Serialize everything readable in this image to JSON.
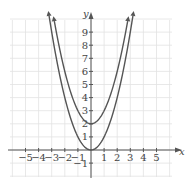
{
  "chart_data": {
    "type": "line",
    "title": "",
    "xlabel": "x",
    "ylabel": "y",
    "xlim": [
      -5.5,
      6.5
    ],
    "ylim": [
      -2,
      10.5
    ],
    "grid": true,
    "legend": null,
    "x_ticks": [
      "-5",
      "-4",
      "-3",
      "-2",
      "-1",
      "1",
      "2",
      "3",
      "4",
      "5"
    ],
    "y_ticks": [
      "-1",
      "1",
      "2",
      "3",
      "4",
      "5",
      "6",
      "7",
      "8",
      "9"
    ],
    "series": [
      {
        "name": "y = x^2",
        "equation": "y = x^2",
        "x": [
          -3.2,
          -3,
          -2,
          -1,
          0,
          1,
          2,
          3,
          3.2
        ],
        "y": [
          10.24,
          9,
          4,
          1,
          0,
          1,
          4,
          9,
          10.24
        ]
      },
      {
        "name": "y = x^2 + 2",
        "equation": "y = x^2 + 2",
        "x": [
          -2.8,
          -2,
          -1,
          0,
          1,
          2,
          2.8
        ],
        "y": [
          9.84,
          6,
          3,
          2,
          3,
          6,
          9.84
        ]
      }
    ],
    "annotations": [
      "arrowheads at curve ends indicate continuation"
    ]
  },
  "axes": {
    "x_label": "x",
    "y_label": "y"
  }
}
